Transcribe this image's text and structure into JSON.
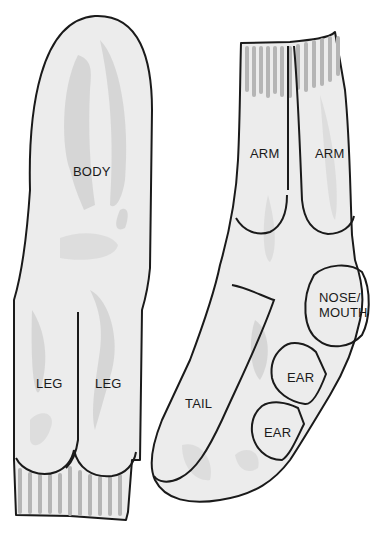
{
  "figure": {
    "left_sock": {
      "regions": [
        {
          "id": "body",
          "label": "BODY"
        },
        {
          "id": "leg-left",
          "label": "LEG"
        },
        {
          "id": "leg-right",
          "label": "LEG"
        }
      ]
    },
    "right_sock": {
      "regions": [
        {
          "id": "arm-left",
          "label": "ARM"
        },
        {
          "id": "arm-right",
          "label": "ARM"
        },
        {
          "id": "nose-mouth",
          "label_lines": [
            "NOSE/",
            "MOUTH"
          ]
        },
        {
          "id": "tail",
          "label": "TAIL"
        },
        {
          "id": "ear-upper",
          "label": "EAR"
        },
        {
          "id": "ear-lower",
          "label": "EAR"
        }
      ]
    },
    "colors": {
      "outline": "#1a1a1a",
      "fabric": "#ececec",
      "shading": "#cfcfcf",
      "ribbing": "#b5b5b5"
    }
  }
}
